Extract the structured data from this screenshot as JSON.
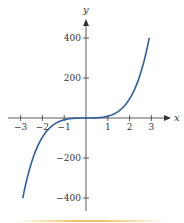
{
  "chart_data": {
    "type": "line",
    "title": "",
    "xlabel": "x",
    "ylabel": "y",
    "xlim": [
      -3.5,
      3.8
    ],
    "ylim": [
      -460,
      480
    ],
    "x_ticks": [
      -3,
      -2,
      -1,
      1,
      2,
      3
    ],
    "x_tick_labels": [
      "−3",
      "−2",
      "−1",
      "1",
      "2",
      "3"
    ],
    "y_ticks": [
      400,
      200,
      -200,
      -400
    ],
    "y_tick_labels": [
      "400",
      "200",
      "−200",
      "−400"
    ],
    "grid": false,
    "legend": null,
    "series": [
      {
        "name": "curve",
        "color": "#2f5fa0",
        "x": [
          -2.9,
          -2.5,
          -2.0,
          -1.5,
          -1.0,
          -0.5,
          0,
          0.5,
          1.0,
          1.5,
          2.0,
          2.5,
          2.9
        ],
        "y": [
          -400,
          -223,
          -96,
          -35,
          -9,
          -1,
          0,
          1,
          9,
          35,
          96,
          223,
          400
        ]
      }
    ]
  },
  "colors": {
    "axis": "#333333",
    "curve": "#2f5fa0",
    "band": "#f2c46a"
  }
}
